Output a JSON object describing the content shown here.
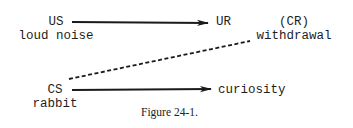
{
  "diagram": {
    "us": {
      "label": "US",
      "description": "loud noise"
    },
    "ur": {
      "label": "UR"
    },
    "cr": {
      "label": "(CR)",
      "description": "withdrawal"
    },
    "cs": {
      "label": "CS",
      "description": "rabbit"
    },
    "cs_response": {
      "label": "curiosity"
    },
    "edges": [
      {
        "from": "US",
        "to": "UR",
        "style": "solid-arrow"
      },
      {
        "from": "CS",
        "to": "(CR) withdrawal",
        "style": "dashed"
      },
      {
        "from": "CS",
        "to": "curiosity",
        "style": "solid-arrow"
      }
    ],
    "line_color": "#1a1a1a"
  },
  "caption": "Figure 24-1."
}
